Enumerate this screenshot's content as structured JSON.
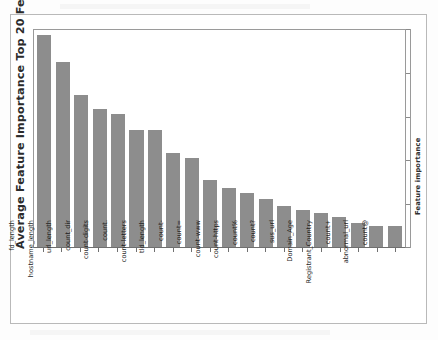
{
  "chart_data": {
    "type": "bar",
    "title": "",
    "ylabel": "Average Feature Importance Top 20 Features",
    "xlabel": "",
    "right_axis_label": "Feature importance",
    "grid": false,
    "legend": false,
    "bar_color": "#8d8d8d",
    "axis_color": "#9a9a9a",
    "ylim": [
      0,
      1.0
    ],
    "y_tick_labels": [],
    "categories": [
      "fd_length",
      "hostname_length",
      "url_length",
      "count_dir",
      "count-digits",
      "count.",
      "count-letters",
      "tld_length",
      "count-",
      "count=",
      "count-www",
      "count-https",
      "count%",
      "count?",
      "sus_url",
      "Domain_Age",
      "Registrant_Country",
      "count+",
      "abnormal_url",
      "count@"
    ],
    "values": [
      0.978,
      0.852,
      0.7,
      0.635,
      0.612,
      0.538,
      0.538,
      0.432,
      0.41,
      0.31,
      0.274,
      0.247,
      0.223,
      0.188,
      0.17,
      0.155,
      0.14,
      0.11,
      0.097,
      0.096
    ]
  },
  "axes": {
    "left_title": "Average Feature Importance Top 20 Features",
    "right_title": "Feature importance"
  }
}
